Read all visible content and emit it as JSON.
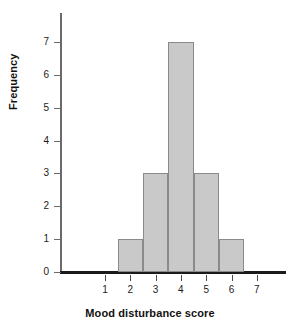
{
  "chart_data": {
    "type": "bar",
    "title": "",
    "subtitle": "",
    "xlabel": "Mood disturbance score",
    "ylabel": "Frequency",
    "categories": [
      "1",
      "2",
      "3",
      "4",
      "5",
      "6",
      "7"
    ],
    "values": [
      0,
      1,
      3,
      7,
      3,
      1,
      0
    ],
    "bars": [
      {
        "category": "2",
        "value": 1,
        "bin_start": 1.5,
        "bin_end": 2.5
      },
      {
        "category": "3",
        "value": 3,
        "bin_start": 2.5,
        "bin_end": 3.5
      },
      {
        "category": "4",
        "value": 7,
        "bin_start": 3.5,
        "bin_end": 4.5
      },
      {
        "category": "5",
        "value": 3,
        "bin_start": 4.5,
        "bin_end": 5.5
      },
      {
        "category": "6",
        "value": 1,
        "bin_start": 5.5,
        "bin_end": 6.5
      }
    ],
    "xlim": [
      0.5,
      7.5
    ],
    "ylim": [
      0,
      7
    ],
    "x_ticks": [
      "1",
      "2",
      "3",
      "4",
      "5",
      "6",
      "7"
    ],
    "y_ticks": [
      "0",
      "1",
      "2",
      "3",
      "4",
      "5",
      "6",
      "7"
    ],
    "grid": false,
    "legend": null,
    "bar_fill_color": "#c9c9c9",
    "bar_border_color": "#8a8a8a",
    "axis_color": "#1a1a1a",
    "background_color": "#ffffff"
  }
}
